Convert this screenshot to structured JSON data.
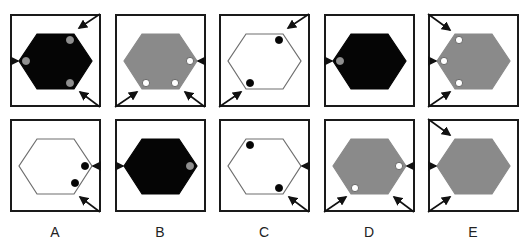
{
  "colors": {
    "black": "#050505",
    "gray": "#8a8a8a",
    "white": "#ffffff",
    "dot_gray": "#8f8f8f",
    "outline": "#6e6e6e",
    "border": "#1a1a1a"
  },
  "options": [
    {
      "label": "A",
      "top": {
        "fill": "black",
        "dots": [
          {
            "pos": "top-right",
            "color": "gray"
          },
          {
            "pos": "left",
            "color": "gray"
          },
          {
            "pos": "bottom-right",
            "color": "gray"
          }
        ],
        "arrows": [
          "top-right-corner",
          "left-middle",
          "bottom-right-corner"
        ]
      },
      "bottom": {
        "fill": "white",
        "dots": [
          {
            "pos": "right-inner",
            "color": "black"
          },
          {
            "pos": "bottom-right-inner",
            "color": "black"
          }
        ],
        "arrows": [
          "right-middle",
          "bottom-right-corner"
        ]
      }
    },
    {
      "label": "B",
      "top": {
        "fill": "gray",
        "dots": [
          {
            "pos": "right-inner",
            "color": "white"
          },
          {
            "pos": "bottom-left",
            "color": "white"
          },
          {
            "pos": "bottom-right",
            "color": "white"
          }
        ],
        "arrows": [
          "right-middle",
          "bottom-left-corner",
          "bottom-right-corner"
        ]
      },
      "bottom": {
        "fill": "black",
        "dots": [
          {
            "pos": "right-inner",
            "color": "gray"
          }
        ],
        "arrows": [
          "left-middle"
        ]
      }
    },
    {
      "label": "C",
      "top": {
        "fill": "white",
        "dots": [
          {
            "pos": "top-right",
            "color": "black"
          },
          {
            "pos": "bottom-left",
            "color": "black"
          }
        ],
        "arrows": [
          "top-right-corner",
          "bottom-left-corner"
        ]
      },
      "bottom": {
        "fill": "white",
        "dots": [
          {
            "pos": "top-left",
            "color": "black"
          },
          {
            "pos": "bottom-right",
            "color": "black"
          }
        ],
        "arrows": [
          "right-middle",
          "bottom-right-corner"
        ]
      }
    },
    {
      "label": "D",
      "top": {
        "fill": "black",
        "dots": [
          {
            "pos": "left",
            "color": "gray"
          }
        ],
        "arrows": [
          "left-middle"
        ]
      },
      "bottom": {
        "fill": "gray",
        "dots": [
          {
            "pos": "right-inner",
            "color": "white"
          },
          {
            "pos": "bottom-left",
            "color": "white"
          }
        ],
        "arrows": [
          "right-middle",
          "bottom-left-corner",
          "bottom-right-corner"
        ]
      }
    },
    {
      "label": "E",
      "top": {
        "fill": "gray",
        "dots": [
          {
            "pos": "top-left",
            "color": "white"
          },
          {
            "pos": "left",
            "color": "white"
          },
          {
            "pos": "bottom-left",
            "color": "white"
          }
        ],
        "arrows": [
          "top-left-corner",
          "left-middle",
          "bottom-left-corner"
        ]
      },
      "bottom": {
        "fill": "gray",
        "dots": [],
        "arrows": [
          "top-left-corner",
          "left-middle",
          "bottom-left-corner"
        ]
      }
    }
  ]
}
